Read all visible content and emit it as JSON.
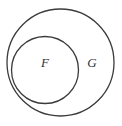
{
  "diagram": {
    "type": "venn-diagram",
    "background_color": "#ffffff",
    "stroke_color": "#3b3b3b",
    "label_color": "#333333",
    "stroke_width": 1.3,
    "sets": [
      {
        "id": "outer",
        "label": "G",
        "shape": "circle",
        "cx": 60.5,
        "cy": 62.5,
        "r": 53.5,
        "label_x": 92,
        "label_y": 64
      },
      {
        "id": "inner",
        "label": "F",
        "shape": "circle",
        "cx": 45,
        "cy": 70,
        "r": 33.5,
        "label_x": 45,
        "label_y": 64
      }
    ]
  }
}
